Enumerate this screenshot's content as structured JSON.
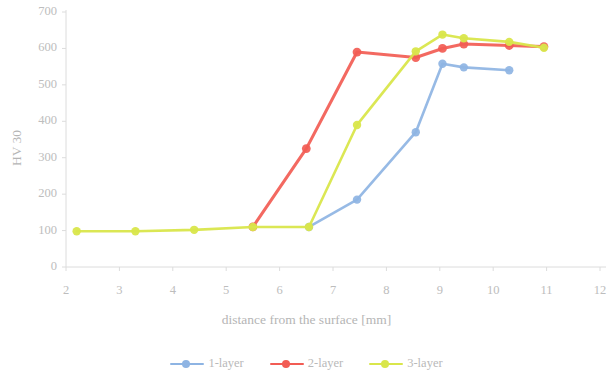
{
  "chart_data": {
    "type": "line",
    "title": "",
    "xlabel": "distance from the surface [mm]",
    "ylabel": "HV 30",
    "xlim": [
      2,
      12
    ],
    "ylim": [
      0,
      700
    ],
    "xticks": [
      "2",
      "3",
      "4",
      "5",
      "6",
      "7",
      "8",
      "9",
      "10",
      "11",
      "12"
    ],
    "yticks": [
      "0",
      "100",
      "200",
      "300",
      "400",
      "500",
      "600",
      "700"
    ],
    "grid": false,
    "legend_position": "bottom",
    "series": [
      {
        "name": "1-layer",
        "color": "#8EB4E3",
        "points": [
          {
            "x": 6.55,
            "y": 110
          },
          {
            "x": 7.45,
            "y": 185
          },
          {
            "x": 8.55,
            "y": 370
          },
          {
            "x": 9.05,
            "y": 558
          },
          {
            "x": 9.45,
            "y": 548
          },
          {
            "x": 10.3,
            "y": 540
          }
        ]
      },
      {
        "name": "2-layer",
        "color": "#F25C54",
        "points": [
          {
            "x": 5.5,
            "y": 110
          },
          {
            "x": 6.5,
            "y": 325
          },
          {
            "x": 7.45,
            "y": 590
          },
          {
            "x": 8.55,
            "y": 575
          },
          {
            "x": 9.05,
            "y": 600
          },
          {
            "x": 9.45,
            "y": 612
          },
          {
            "x": 10.3,
            "y": 608
          },
          {
            "x": 10.95,
            "y": 605
          }
        ]
      },
      {
        "name": "3-layer",
        "color": "#D9E64B",
        "points": [
          {
            "x": 2.2,
            "y": 98
          },
          {
            "x": 3.3,
            "y": 98
          },
          {
            "x": 4.4,
            "y": 102
          },
          {
            "x": 5.5,
            "y": 110
          },
          {
            "x": 6.55,
            "y": 110
          },
          {
            "x": 7.45,
            "y": 390
          },
          {
            "x": 8.55,
            "y": 592
          },
          {
            "x": 9.05,
            "y": 638
          },
          {
            "x": 9.45,
            "y": 628
          },
          {
            "x": 10.3,
            "y": 618
          },
          {
            "x": 10.95,
            "y": 602
          }
        ]
      }
    ]
  },
  "legend": {
    "items": [
      {
        "label": "1-layer",
        "color": "#8EB4E3"
      },
      {
        "label": "2-layer",
        "color": "#F25C54"
      },
      {
        "label": "3-layer",
        "color": "#D9E64B"
      }
    ]
  }
}
